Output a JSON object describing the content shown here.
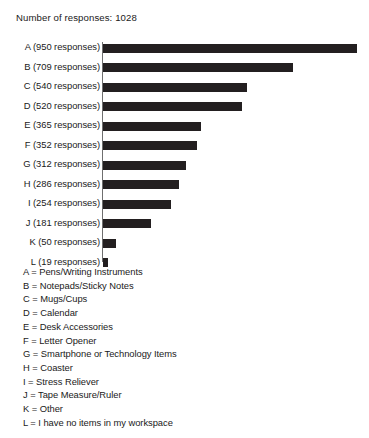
{
  "chart_data": {
    "type": "bar",
    "orientation": "horizontal",
    "title": "Number of responses: 1028",
    "xlabel": "",
    "ylabel": "",
    "total_responses": 1028,
    "categories": [
      "A (950 responses)",
      "B (709 responses)",
      "C (540 responses)",
      "D (520 responses)",
      "E (365 responses)",
      "F (352 responses)",
      "G (312 responses)",
      "H (286 responses)",
      "I (254 responses)",
      "J (181 responses)",
      "K (50 responses)",
      "L (19 responses)"
    ],
    "keys": [
      "A",
      "B",
      "C",
      "D",
      "E",
      "F",
      "G",
      "H",
      "I",
      "J",
      "K",
      "L"
    ],
    "values": [
      950,
      709,
      540,
      520,
      365,
      352,
      312,
      286,
      254,
      181,
      50,
      19
    ],
    "xlim": [
      0,
      950
    ],
    "grid": false,
    "legend_position": "below-plot",
    "bar_color": "#231f20",
    "axis_color": "#6f6f6f",
    "legend": [
      "A = Pens/Writing Instruments",
      "B = Notepads/Sticky Notes",
      "C = Mugs/Cups",
      "D = Calendar",
      "E = Desk Accessories",
      "F = Letter Opener",
      "G = Smartphone or Technology Items",
      "H = Coaster",
      "I = Stress Reliever",
      "J = Tape Measure/Ruler",
      "K = Other",
      "L = I have no items in my workspace"
    ]
  }
}
